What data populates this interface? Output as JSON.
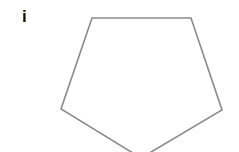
{
  "figure": {
    "label": "i",
    "shape": "pentagon",
    "stroke_color": "#8a8a8a",
    "fill_color": "#ffffff",
    "vertices": [
      [
        92,
        18
      ],
      [
        191,
        18
      ],
      [
        222,
        110
      ],
      [
        141,
        158
      ],
      [
        61,
        109
      ]
    ]
  }
}
